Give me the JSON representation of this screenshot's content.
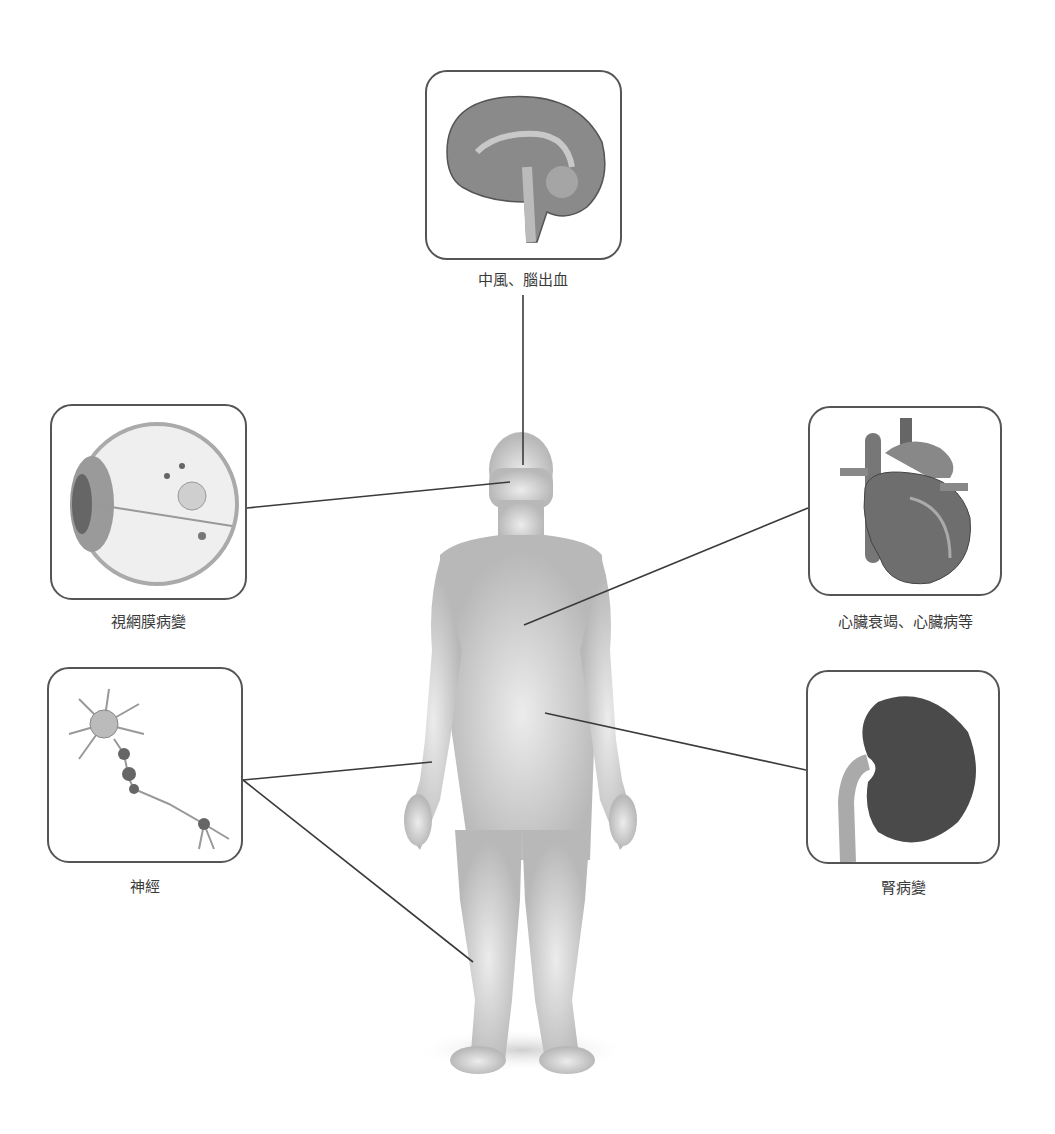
{
  "diagram": {
    "type": "body-complications-map",
    "center_figure": "human-body-silhouette",
    "panels": [
      {
        "id": "brain",
        "label": "中風、腦出血",
        "icon": "brain-icon",
        "box": [
          425,
          70,
          197,
          190
        ],
        "label_pos": [
          523,
          278
        ],
        "line": [
          [
            523,
            295
          ],
          [
            523,
            465
          ]
        ]
      },
      {
        "id": "eye",
        "label": "視網膜病變",
        "icon": "eye-icon",
        "box": [
          50,
          404,
          197,
          196
        ],
        "label_pos": [
          148,
          620
        ],
        "line": [
          [
            247,
            508
          ],
          [
            510,
            482
          ]
        ]
      },
      {
        "id": "heart",
        "label": "心臟衰竭、心臟病等",
        "icon": "heart-icon",
        "box": [
          808,
          406,
          194,
          190
        ],
        "label_pos": [
          905,
          620
        ],
        "line": [
          [
            808,
            508
          ],
          [
            524,
            625
          ]
        ]
      },
      {
        "id": "nerve",
        "label": "神經",
        "icon": "neuron-icon",
        "box": [
          47,
          667,
          196,
          196
        ],
        "label_pos": [
          145,
          885
        ],
        "line": [
          [
            243,
            780
          ],
          [
            432,
            762
          ]
        ],
        "line2": [
          [
            243,
            780
          ],
          [
            473,
            962
          ]
        ]
      },
      {
        "id": "kidney",
        "label": "腎病變",
        "icon": "kidney-icon",
        "box": [
          806,
          670,
          194,
          194
        ],
        "label_pos": [
          903,
          886
        ],
        "line": [
          [
            806,
            770
          ],
          [
            545,
            713
          ]
        ]
      }
    ]
  }
}
